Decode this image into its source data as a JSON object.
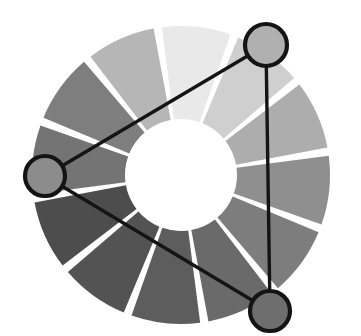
{
  "figure": {
    "type": "color-wheel-diagram",
    "canvas": {
      "width": 361,
      "height": 336,
      "background": "#ffffff"
    }
  },
  "wheel": {
    "center_x": 181,
    "center_y": 175,
    "outer_radius": 149,
    "inner_radius": 56,
    "segment_count": 12,
    "gap_degrees": 3.2,
    "start_angle_degrees": -99,
    "hub_color": "#ffffff",
    "segments": [
      {
        "index": 1,
        "name": "segment-01",
        "position": "top",
        "color": "#e9e9e9",
        "start_deg": -99,
        "end_deg": -69
      },
      {
        "index": 2,
        "name": "segment-02",
        "position": "top-right",
        "color": "#cfcfcf",
        "start_deg": -69,
        "end_deg": -39
      },
      {
        "index": 3,
        "name": "segment-03",
        "position": "upper-right",
        "color": "#adadad",
        "start_deg": -39,
        "end_deg": -9
      },
      {
        "index": 4,
        "name": "segment-04",
        "position": "right",
        "color": "#8f8f8f",
        "start_deg": -9,
        "end_deg": 21
      },
      {
        "index": 5,
        "name": "segment-05",
        "position": "lower-right",
        "color": "#7d7d7d",
        "start_deg": 21,
        "end_deg": 51
      },
      {
        "index": 6,
        "name": "segment-06",
        "position": "bottom-right",
        "color": "#6a6a6a",
        "start_deg": 51,
        "end_deg": 81
      },
      {
        "index": 7,
        "name": "segment-07",
        "position": "bottom",
        "color": "#5d5d5d",
        "start_deg": 81,
        "end_deg": 111
      },
      {
        "index": 8,
        "name": "segment-08",
        "position": "bottom-left",
        "color": "#535353",
        "start_deg": 111,
        "end_deg": 141
      },
      {
        "index": 9,
        "name": "segment-09",
        "position": "lower-left",
        "color": "#4d4d4d",
        "start_deg": 141,
        "end_deg": 171
      },
      {
        "index": 10,
        "name": "segment-10",
        "position": "left",
        "color": "#747474",
        "start_deg": 171,
        "end_deg": 201
      },
      {
        "index": 11,
        "name": "segment-11",
        "position": "upper-left",
        "color": "#7e7e7e",
        "start_deg": 201,
        "end_deg": 231
      },
      {
        "index": 12,
        "name": "segment-12",
        "position": "top-left",
        "color": "#b6b6b6",
        "start_deg": 231,
        "end_deg": 261
      }
    ]
  },
  "markers": [
    {
      "name": "marker-top-right",
      "cx": 266,
      "cy": 45,
      "r": 21,
      "fill": "#b0b0b0",
      "stroke": "#141414"
    },
    {
      "name": "marker-left",
      "cx": 45,
      "cy": 176,
      "r": 20,
      "fill": "#8c8c8c",
      "stroke": "#141414"
    },
    {
      "name": "marker-bottom-right",
      "cx": 270,
      "cy": 311,
      "r": 20,
      "fill": "#6e6e6e",
      "stroke": "#141414"
    }
  ],
  "connectors": [
    {
      "name": "connector-topright-to-left",
      "x1": 266,
      "y1": 45,
      "x2": 45,
      "y2": 176
    },
    {
      "name": "connector-left-to-bottomright",
      "x1": 45,
      "y1": 176,
      "x2": 270,
      "y2": 311
    },
    {
      "name": "connector-topright-to-bottomright",
      "x1": 266,
      "y1": 45,
      "x2": 270,
      "y2": 311
    }
  ],
  "chart_data": {
    "type": "pie",
    "categories": [
      "hue-01",
      "hue-02",
      "hue-03",
      "hue-04",
      "hue-05",
      "hue-06",
      "hue-07",
      "hue-08",
      "hue-09",
      "hue-10",
      "hue-11",
      "hue-12"
    ],
    "values": [
      30,
      30,
      30,
      30,
      30,
      30,
      30,
      30,
      30,
      30,
      30,
      30
    ],
    "colors": [
      "#e9e9e9",
      "#cfcfcf",
      "#adadad",
      "#8f8f8f",
      "#7d7d7d",
      "#6a6a6a",
      "#5d5d5d",
      "#535353",
      "#4d4d4d",
      "#747474",
      "#7e7e7e",
      "#b6b6b6"
    ],
    "donut_inner_ratio": 0.376,
    "selected_indices": [
      1,
      5,
      9
    ],
    "legend": "none",
    "grid": false,
    "xlabel": "",
    "ylabel": ""
  }
}
